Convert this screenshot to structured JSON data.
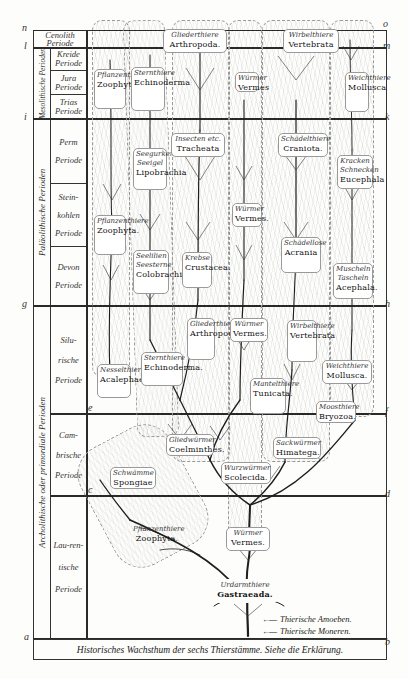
{
  "figure": {
    "caption": "Historisches Wachsthum der sechs Thierstämme. Siehe die Erklärung.",
    "left_markers": [
      "n",
      "l",
      "i",
      "g",
      "e",
      "c",
      "a"
    ],
    "right_markers": [
      "o",
      "m",
      "k",
      "h",
      "f",
      "d",
      "b"
    ]
  },
  "eras": [
    {
      "id": "cenolith",
      "label": "Cenolith Periode"
    },
    {
      "id": "mesolith",
      "label": "Mesolithische Perioden"
    },
    {
      "id": "palaeolith",
      "label": "Paläolithische Perioden"
    },
    {
      "id": "archolith",
      "label": "Archolithische oder primordiale Perioden"
    }
  ],
  "periods": [
    {
      "id": "cenolith",
      "label": "Cenolith Periode"
    },
    {
      "id": "kreide",
      "label": "Kreide Periode"
    },
    {
      "id": "jura",
      "label": "Jura Periode"
    },
    {
      "id": "trias",
      "label": "Trias Periode"
    },
    {
      "id": "perm",
      "label": "Perm Periode"
    },
    {
      "id": "steinkohlen",
      "label": "Stein-kohlen Periode"
    },
    {
      "id": "devon",
      "label": "Devon Periode"
    },
    {
      "id": "silur",
      "label": "Silu-rische Periode"
    },
    {
      "id": "cambrisch",
      "label": "Cam-brische Periode"
    },
    {
      "id": "laurentisch",
      "label": "Lau-ren-tische Periode"
    }
  ],
  "phyla_labels": [
    {
      "id": "zoophyta-top",
      "de": "Pflanzenthiere",
      "la": "Zoophyta"
    },
    {
      "id": "echinoderma-top",
      "de": "Sternthiere",
      "la": "Echinoderma"
    },
    {
      "id": "arthropoda-top",
      "de": "Gliederthiere",
      "la": "Arthropoda."
    },
    {
      "id": "vermes-top",
      "de": "Würmer",
      "la": "Vermes"
    },
    {
      "id": "vertebrata-top",
      "de": "Wirbelthiere",
      "la": "Vertebrata"
    },
    {
      "id": "mollusca-top",
      "de": "Weichthiere",
      "la": "Mollusca"
    },
    {
      "id": "lipobrachia",
      "de": "Seegurken Seeigel",
      "la": "Lipobrachia"
    },
    {
      "id": "tracheata",
      "de": "Insecten etc.",
      "la": "Tracheata"
    },
    {
      "id": "craniota",
      "de": "Schädelthiere",
      "la": "Craniota."
    },
    {
      "id": "eucephala",
      "de": "Kracken Schnecken",
      "la": "Eucephala"
    },
    {
      "id": "zoophyta-mid",
      "de": "Pflanzenthiere",
      "la": "Zoophyta."
    },
    {
      "id": "vermes-mid",
      "de": "Würmer",
      "la": "Vermes."
    },
    {
      "id": "colobrachia",
      "de": "Seelilien Seesterne",
      "la": "Colobrachia"
    },
    {
      "id": "crustacea",
      "de": "Krebse",
      "la": "Crustacea."
    },
    {
      "id": "acrania",
      "de": "Schädellose",
      "la": "Acrania"
    },
    {
      "id": "acephala",
      "de": "Muscheln Tascheln",
      "la": "Acephala."
    },
    {
      "id": "acalephae",
      "de": "Nesselthiere",
      "la": "Acalephae."
    },
    {
      "id": "echinoderma-low",
      "de": "Sternthiere",
      "la": "Echinoderma."
    },
    {
      "id": "arthropoda-low",
      "de": "Gliederthiere",
      "la": "Arthropoda."
    },
    {
      "id": "vermes-low",
      "de": "Würmer",
      "la": "Vermes."
    },
    {
      "id": "vertebrata-low",
      "de": "Wirbelthiere",
      "la": "Vertebrata"
    },
    {
      "id": "tunicata",
      "de": "Mantelthiere",
      "la": "Tunicata."
    },
    {
      "id": "mollusca-low",
      "de": "Weichthiere",
      "la": "Mollusca."
    },
    {
      "id": "bryozoa",
      "de": "Moosthiere",
      "la": "Bryozoa."
    },
    {
      "id": "coelminthes",
      "de": "Gliedwürmer",
      "la": "Coelminthes."
    },
    {
      "id": "himatega",
      "de": "Sackwürmer",
      "la": "Himatega."
    },
    {
      "id": "spongiae",
      "de": "Schwämme",
      "la": "Spongiae"
    },
    {
      "id": "scolecida",
      "de": "Wurzwürmer",
      "la": "Scolecida."
    },
    {
      "id": "zoophyta-low",
      "de": "Pflanzenthiere",
      "la": "Zoophyta."
    },
    {
      "id": "vermes-root",
      "de": "Würmer",
      "la": "Vermes."
    },
    {
      "id": "gastraeada",
      "de": "Urdarmthiere",
      "la": "Gastraeada."
    }
  ],
  "legend": [
    {
      "id": "amoeben",
      "label": "Thierische Amoeben.",
      "arrow": "←—"
    },
    {
      "id": "moneren",
      "label": "Thierische Moneren.",
      "arrow": "←—"
    }
  ]
}
